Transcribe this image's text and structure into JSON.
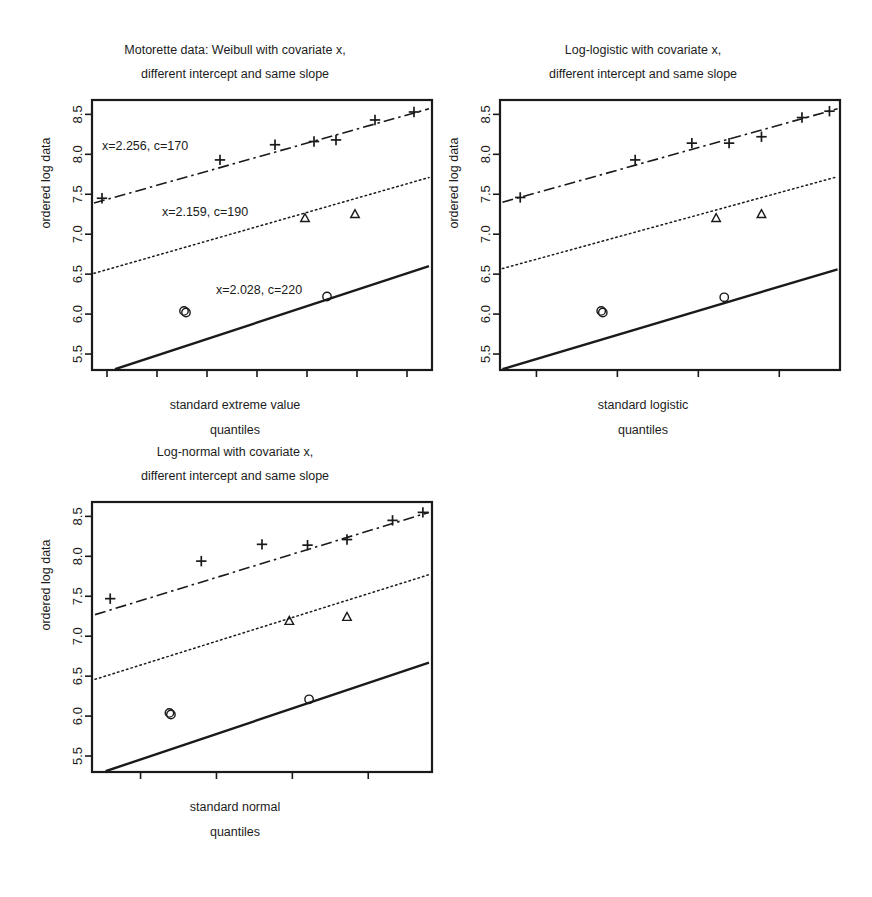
{
  "figure": {
    "background": "#ffffff",
    "ink": "#1a1a1a",
    "width": 872,
    "height": 897
  },
  "chart_data": [
    {
      "type": "scatter",
      "id": "weibull-panel",
      "title": "Motorette data: Weibull with covariate x,",
      "subtitle": "different intercept and same slope",
      "xlabel": "standard extreme value",
      "xlabel2": "quantiles",
      "ylabel": "ordered log data",
      "xlim": [
        -3.15,
        0.25
      ],
      "ylim": [
        5.3,
        8.68
      ],
      "xticks": [
        -3.0,
        -2.5,
        -2.0,
        -1.5,
        -1.0,
        -0.5,
        0.0
      ],
      "xticklabels": [
        "-3.0",
        "-2.5",
        "-2.0",
        "-1.5",
        "-1.0",
        "-0.5",
        "0.0"
      ],
      "yticks": [
        5.5,
        6.0,
        6.5,
        7.0,
        7.5,
        8.0,
        8.5
      ],
      "yticklabels": [
        "5.5",
        "6.0",
        "6.5",
        "7.0",
        "7.5",
        "8.0",
        "8.5"
      ],
      "grid": false,
      "legend": "none",
      "annotations": [
        {
          "text": "x=2.256, c=170",
          "x": -2.62,
          "y": 8.06
        },
        {
          "text": "x=2.159, c=190",
          "x": -2.02,
          "y": 7.23
        },
        {
          "text": "x=2.028, c=220",
          "x": -1.48,
          "y": 6.25
        }
      ],
      "series": [
        {
          "name": "x=2.256, c=170",
          "covariate": 2.256,
          "temperature": 170,
          "marker": "plus",
          "linestyle": "dashdot",
          "color": "#1a1a1a",
          "fit_line": {
            "x": [
              -3.13,
              0.22
            ],
            "y": [
              7.39,
              8.57
            ]
          },
          "points": [
            {
              "x": -3.05,
              "y": 7.45
            },
            {
              "x": -1.87,
              "y": 7.93
            },
            {
              "x": -1.32,
              "y": 8.12
            },
            {
              "x": -0.93,
              "y": 8.16
            },
            {
              "x": -0.71,
              "y": 8.18
            },
            {
              "x": -0.32,
              "y": 8.43
            },
            {
              "x": 0.07,
              "y": 8.53
            }
          ]
        },
        {
          "name": "x=2.159, c=190",
          "covariate": 2.159,
          "temperature": 190,
          "marker": "triangle",
          "linestyle": "dotted",
          "color": "#1a1a1a",
          "fit_line": {
            "x": [
              -3.13,
              0.22
            ],
            "y": [
              6.51,
              7.71
            ]
          },
          "points": [
            {
              "x": -1.02,
              "y": 7.2
            },
            {
              "x": -0.52,
              "y": 7.25
            }
          ]
        },
        {
          "name": "x=2.028, c=220",
          "covariate": 2.028,
          "temperature": 220,
          "marker": "circle",
          "linestyle": "solid",
          "color": "#1a1a1a",
          "fit_line": {
            "x": [
              -2.92,
              0.22
            ],
            "y": [
              5.31,
              6.6
            ]
          },
          "points": [
            {
              "x": -2.21,
              "y": 6.02
            },
            {
              "x": -2.23,
              "y": 6.04
            },
            {
              "x": -0.8,
              "y": 6.22
            }
          ]
        }
      ]
    },
    {
      "type": "scatter",
      "id": "loglogistic-panel",
      "title": "Log-logistic with covariate x,",
      "subtitle": "different intercept and same slope",
      "xlabel": "standard logistic",
      "xlabel2": "quantiles",
      "ylabel": "ordered log data",
      "xlim": [
        -3.45,
        0.75
      ],
      "ylim": [
        5.3,
        8.68
      ],
      "xticks": [
        -3,
        -2,
        -1,
        0
      ],
      "xticklabels": [
        "-3",
        "-2",
        "-1",
        "0"
      ],
      "yticks": [
        5.5,
        6.0,
        6.5,
        7.0,
        7.5,
        8.0,
        8.5
      ],
      "yticklabels": [
        "5.5",
        "6.0",
        "6.5",
        "7.0",
        "7.5",
        "8.0",
        "8.5"
      ],
      "grid": false,
      "legend": "none",
      "annotations": [],
      "series": [
        {
          "name": "x=2.256, c=170",
          "covariate": 2.256,
          "temperature": 170,
          "marker": "plus",
          "linestyle": "dashdot",
          "color": "#1a1a1a",
          "fit_line": {
            "x": [
              -3.42,
              0.72
            ],
            "y": [
              7.4,
              8.57
            ]
          },
          "points": [
            {
              "x": -3.2,
              "y": 7.46
            },
            {
              "x": -1.78,
              "y": 7.93
            },
            {
              "x": -1.08,
              "y": 8.14
            },
            {
              "x": -0.62,
              "y": 8.14
            },
            {
              "x": -0.22,
              "y": 8.22
            },
            {
              "x": 0.28,
              "y": 8.46
            },
            {
              "x": 0.62,
              "y": 8.54
            }
          ]
        },
        {
          "name": "x=2.159, c=190",
          "covariate": 2.159,
          "temperature": 190,
          "marker": "triangle",
          "linestyle": "dotted",
          "color": "#1a1a1a",
          "fit_line": {
            "x": [
              -3.42,
              0.72
            ],
            "y": [
              6.57,
              7.72
            ]
          },
          "points": [
            {
              "x": -0.78,
              "y": 7.2
            },
            {
              "x": -0.22,
              "y": 7.25
            }
          ]
        },
        {
          "name": "x=2.028, c=220",
          "covariate": 2.028,
          "temperature": 220,
          "marker": "circle",
          "linestyle": "solid",
          "color": "#1a1a1a",
          "fit_line": {
            "x": [
              -3.42,
              0.72
            ],
            "y": [
              5.31,
              6.56
            ]
          },
          "points": [
            {
              "x": -2.18,
              "y": 6.02
            },
            {
              "x": -2.2,
              "y": 6.04
            },
            {
              "x": -0.68,
              "y": 6.21
            }
          ]
        }
      ]
    },
    {
      "type": "scatter",
      "id": "lognormal-panel",
      "title": "Log-normal with covariate x,",
      "subtitle": "different intercept and same slope",
      "xlabel": "standard normal",
      "xlabel2": "quantiles",
      "ylabel": "ordered log data",
      "xlim": [
        -1.82,
        0.42
      ],
      "ylim": [
        5.3,
        8.68
      ],
      "xticks": [
        -1.5,
        -1.0,
        -0.5,
        0.0
      ],
      "xticklabels": [
        "-1.5",
        "-1.0",
        "-0.5",
        "0.0"
      ],
      "yticks": [
        5.5,
        6.0,
        6.5,
        7.0,
        7.5,
        8.0,
        8.5
      ],
      "yticklabels": [
        "5.5",
        "6.0",
        "6.5",
        "7.0",
        "7.5",
        "8.0",
        "8.5"
      ],
      "grid": false,
      "legend": "none",
      "annotations": [],
      "series": [
        {
          "name": "x=2.256, c=170",
          "covariate": 2.256,
          "temperature": 170,
          "marker": "plus",
          "linestyle": "dashdot",
          "color": "#1a1a1a",
          "fit_line": {
            "x": [
              -1.8,
              0.4
            ],
            "y": [
              7.27,
              8.55
            ]
          },
          "points": [
            {
              "x": -1.7,
              "y": 7.47
            },
            {
              "x": -1.1,
              "y": 7.94
            },
            {
              "x": -0.7,
              "y": 8.15
            },
            {
              "x": -0.4,
              "y": 8.14
            },
            {
              "x": -0.14,
              "y": 8.21
            },
            {
              "x": 0.16,
              "y": 8.45
            },
            {
              "x": 0.36,
              "y": 8.55
            }
          ]
        },
        {
          "name": "x=2.159, c=190",
          "covariate": 2.159,
          "temperature": 190,
          "marker": "triangle",
          "linestyle": "dotted",
          "color": "#1a1a1a",
          "fit_line": {
            "x": [
              -1.8,
              0.4
            ],
            "y": [
              6.46,
              7.77
            ]
          },
          "points": [
            {
              "x": -0.52,
              "y": 7.19
            },
            {
              "x": -0.14,
              "y": 7.24
            }
          ]
        },
        {
          "name": "x=2.028, c=220",
          "covariate": 2.028,
          "temperature": 220,
          "marker": "circle",
          "linestyle": "solid",
          "color": "#1a1a1a",
          "fit_line": {
            "x": [
              -1.73,
              0.4
            ],
            "y": [
              5.31,
              6.67
            ]
          },
          "points": [
            {
              "x": -1.3,
              "y": 6.02
            },
            {
              "x": -1.31,
              "y": 6.04
            },
            {
              "x": -0.39,
              "y": 6.21
            }
          ]
        }
      ]
    }
  ]
}
